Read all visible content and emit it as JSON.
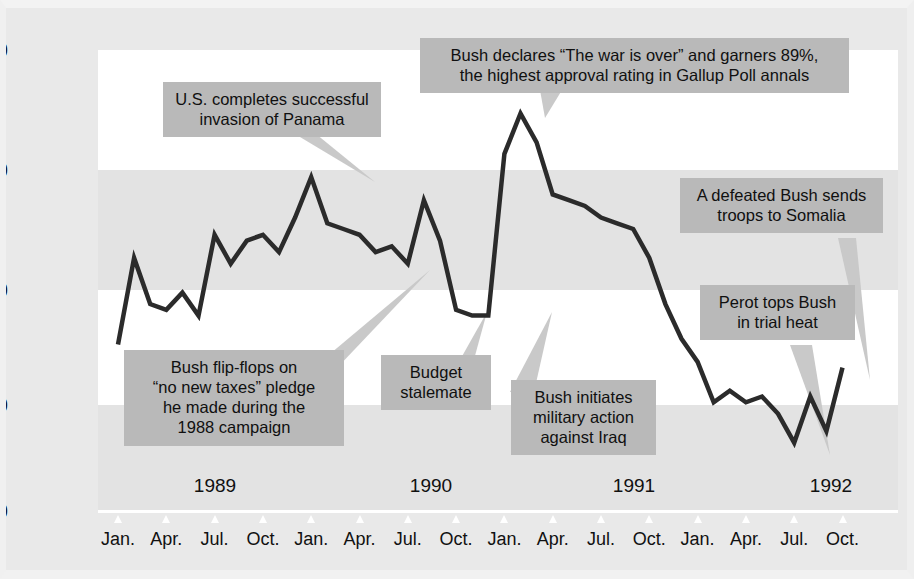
{
  "chart_data": {
    "type": "line",
    "title": "",
    "subtitle": "",
    "xlabel": "",
    "ylabel": "Percentage Responding \"Approve\"",
    "ylim": [
      20,
      100
    ],
    "yticks": [
      100,
      80,
      60,
      40,
      20
    ],
    "ytick_labels": [
      "100",
      "80",
      "60",
      "40",
      "20"
    ],
    "xtick_labels": [
      "Jan.",
      "Apr.",
      "Jul.",
      "Oct.",
      "Jan.",
      "Apr.",
      "Jul.",
      "Oct.",
      "Jan.",
      "Apr.",
      "Jul.",
      "Oct.",
      "Jan.",
      "Apr.",
      "Jul.",
      "Oct."
    ],
    "year_labels": [
      "1989",
      "1990",
      "1991",
      "1992"
    ],
    "grid": "horizontal-bands",
    "legend": "none",
    "series": [
      {
        "name": "Bush approval rating",
        "x": [
          "1989-01",
          "1989-02",
          "1989-03",
          "1989-04",
          "1989-05",
          "1989-06",
          "1989-07",
          "1989-08",
          "1989-09",
          "1989-10",
          "1989-11",
          "1989-12",
          "1990-01",
          "1990-02",
          "1990-03",
          "1990-04",
          "1990-05",
          "1990-06",
          "1990-07",
          "1990-08",
          "1990-09",
          "1990-10",
          "1990-11",
          "1990-12",
          "1991-01",
          "1991-02",
          "1991-03",
          "1991-04",
          "1991-05",
          "1991-06",
          "1991-07",
          "1991-08",
          "1991-09",
          "1991-10",
          "1991-11",
          "1991-12",
          "1992-01",
          "1992-02",
          "1992-03",
          "1992-04",
          "1992-05",
          "1992-06",
          "1992-07",
          "1992-08",
          "1992-09",
          "1992-10"
        ],
        "values": [
          49,
          64,
          56,
          55,
          58,
          54,
          68,
          63,
          67,
          68,
          65,
          71,
          78,
          70,
          69,
          68,
          65,
          66,
          63,
          74,
          67,
          55,
          54,
          54,
          82,
          89,
          84,
          75,
          74,
          73,
          71,
          70,
          69,
          64,
          56,
          50,
          46,
          39,
          41,
          39,
          40,
          37,
          32,
          40,
          34,
          45
        ]
      }
    ],
    "annotations": [
      {
        "id": "panama",
        "text_lines": [
          "U.S. completes successful",
          "invasion of Panama"
        ],
        "anchor_value": 78,
        "anchor_x": "1990-01"
      },
      {
        "id": "war-over",
        "text_lines": [
          "Bush declares \"The war is over\" and garners 89%,",
          "the highest approval rating in Gallup Poll annals"
        ],
        "anchor_value": 89,
        "anchor_x": "1991-02"
      },
      {
        "id": "somalia",
        "text_lines": [
          "A defeated Bush sends",
          "troops to Somalia"
        ],
        "anchor_value": 45,
        "anchor_x": "1992-10"
      },
      {
        "id": "perot",
        "text_lines": [
          "Perot tops Bush",
          "in trial heat"
        ],
        "anchor_value": 32,
        "anchor_x": "1992-07"
      },
      {
        "id": "flip-flops",
        "text_lines": [
          "Bush flip-flops on",
          "\"no new taxes\" pledge",
          "he made during the",
          "1988 campaign"
        ],
        "anchor_value": 63,
        "anchor_x": "1990-07"
      },
      {
        "id": "budget",
        "text_lines": [
          "Budget",
          "stalemate"
        ],
        "anchor_value": 55,
        "anchor_x": "1990-10"
      },
      {
        "id": "iraq",
        "text_lines": [
          "Bush initiates",
          "military action",
          "against Iraq"
        ],
        "anchor_value": 54,
        "anchor_x": "1990-12"
      }
    ],
    "colors": {
      "band_white": "#ffffff",
      "band_gray": "#e3e3e3",
      "figure_background": "#e9e9e9",
      "line": "#2b2b2b",
      "callout_background": "#b9b9b9",
      "text": "#101010"
    }
  },
  "annotations_text": {
    "panama": "U.S. completes successful\ninvasion of Panama",
    "panama_l1": "U.S. completes successful",
    "panama_l2": "invasion of Panama",
    "war_l1": "Bush declares “The war is over” and garners 89%,",
    "war_l2": "the highest approval rating in Gallup Poll annals",
    "somalia_l1": "A defeated Bush sends",
    "somalia_l2": "troops to Somalia",
    "perot_l1": "Perot tops Bush",
    "perot_l2": "in trial heat",
    "flip_l1": "Bush flip-flops on",
    "flip_l2": "“no new taxes” pledge",
    "flip_l3": "he made during the",
    "flip_l4": "1988 campaign",
    "budget_l1": "Budget",
    "budget_l2": "stalemate",
    "iraq_l1": "Bush initiates",
    "iraq_l2": "military action",
    "iraq_l3": "against Iraq"
  },
  "axis": {
    "y_title": "Percentage Responding “Approve”",
    "y_100": "100",
    "y_80": "80",
    "y_60": "60",
    "y_40": "40",
    "y_20": "20",
    "year_1989": "1989",
    "year_1990": "1990",
    "year_1991": "1991",
    "year_1992": "1992",
    "months": [
      "Jan.",
      "Apr.",
      "Jul.",
      "Oct.",
      "Jan.",
      "Apr.",
      "Jul.",
      "Oct.",
      "Jan.",
      "Apr.",
      "Jul.",
      "Oct.",
      "Jan.",
      "Apr.",
      "Jul.",
      "Oct."
    ]
  }
}
